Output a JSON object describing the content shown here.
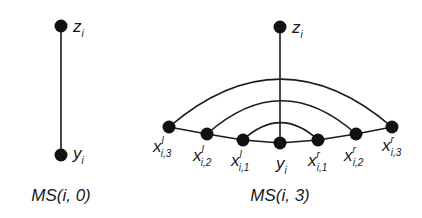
{
  "diagrams": [
    {
      "caption": "MS(i, 0)",
      "nodes": [
        {
          "id": "z",
          "label": "z",
          "sub": "i",
          "sup": ""
        },
        {
          "id": "y",
          "label": "y",
          "sub": "i",
          "sup": ""
        }
      ],
      "edges": [
        [
          "z",
          "y"
        ]
      ]
    },
    {
      "caption": "MS(i, 3)",
      "nodes": [
        {
          "id": "z",
          "label": "z",
          "sub": "i",
          "sup": ""
        },
        {
          "id": "y",
          "label": "y",
          "sub": "i",
          "sup": ""
        },
        {
          "id": "l1",
          "label": "x",
          "sub": "i,1",
          "sup": "l"
        },
        {
          "id": "l2",
          "label": "x",
          "sub": "i,2",
          "sup": "l"
        },
        {
          "id": "l3",
          "label": "x",
          "sub": "i,3",
          "sup": "l"
        },
        {
          "id": "r1",
          "label": "x",
          "sub": "i,1",
          "sup": "r"
        },
        {
          "id": "r2",
          "label": "x",
          "sub": "i,2",
          "sup": "r"
        },
        {
          "id": "r3",
          "label": "x",
          "sub": "i,3",
          "sup": "r"
        }
      ],
      "edges": [
        [
          "z",
          "y"
        ],
        [
          "l3",
          "l2"
        ],
        [
          "l2",
          "l1"
        ],
        [
          "l1",
          "y"
        ],
        [
          "y",
          "r1"
        ],
        [
          "r1",
          "r2"
        ],
        [
          "r2",
          "r3"
        ]
      ],
      "arcs": [
        [
          "l1",
          "r1"
        ],
        [
          "l2",
          "r2"
        ],
        [
          "l3",
          "r3"
        ]
      ]
    }
  ]
}
